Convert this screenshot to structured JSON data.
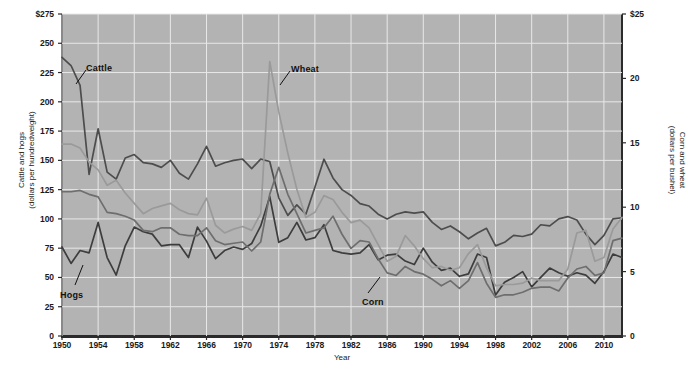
{
  "chart_data": {
    "type": "line",
    "title": "",
    "xlabel": "Year",
    "ylabel_left": "Cattle and hogs\n(dollars per hundredweight)",
    "ylabel_right": "Corn and wheat\n(dollars per bushel)",
    "grid": true,
    "legend_position": "inline-annotations",
    "xlim": [
      1950,
      2012
    ],
    "ylim_left": [
      0,
      275
    ],
    "ylim_right": [
      0,
      25
    ],
    "x": [
      1950,
      1951,
      1952,
      1953,
      1954,
      1955,
      1956,
      1957,
      1958,
      1959,
      1960,
      1961,
      1962,
      1963,
      1964,
      1965,
      1966,
      1967,
      1968,
      1969,
      1970,
      1971,
      1972,
      1973,
      1974,
      1975,
      1976,
      1977,
      1978,
      1979,
      1980,
      1981,
      1982,
      1983,
      1984,
      1985,
      1986,
      1987,
      1988,
      1989,
      1990,
      1991,
      1992,
      1993,
      1994,
      1995,
      1996,
      1997,
      1998,
      1999,
      2000,
      2001,
      2002,
      2003,
      2004,
      2005,
      2006,
      2007,
      2008,
      2009,
      2010,
      2011,
      2012
    ],
    "xticks": [
      "1950",
      "1954",
      "1958",
      "1962",
      "1966",
      "1970",
      "1974",
      "1978",
      "1982",
      "1986",
      "1990",
      "1994",
      "1998",
      "2002",
      "2006",
      "2010"
    ],
    "yticks_left": [
      "0",
      "25",
      "50",
      "75",
      "100",
      "125",
      "150",
      "175",
      "200",
      "225",
      "250",
      "$275"
    ],
    "yticks_right": [
      "0",
      "5",
      "10",
      "15",
      "20",
      "$25"
    ],
    "series": [
      {
        "name": "Cattle",
        "axis": "left",
        "color": "#4d4d4d",
        "unit": "dollars per hundredweight",
        "values": [
          238,
          231,
          214,
          138,
          177,
          140,
          134,
          152,
          155,
          148,
          147,
          144,
          150,
          139,
          134,
          147,
          162,
          145,
          148,
          150,
          151,
          143,
          151,
          149,
          118,
          103,
          112,
          104,
          127,
          151,
          135,
          125,
          120,
          113,
          111,
          104,
          100,
          104,
          106,
          105,
          106,
          97,
          91,
          94,
          89,
          83,
          88,
          92,
          77,
          80,
          86,
          85,
          87,
          95,
          94,
          100,
          102,
          99,
          87,
          78,
          86,
          100,
          101
        ]
      },
      {
        "name": "Hogs",
        "axis": "left",
        "color": "#3d3d3d",
        "unit": "dollars per hundredweight",
        "values": [
          76,
          62,
          73,
          71,
          97,
          67,
          52,
          77,
          93,
          89,
          87,
          77,
          78,
          78,
          67,
          93,
          81,
          66,
          73,
          76,
          74,
          79,
          94,
          119,
          80,
          84,
          97,
          82,
          84,
          95,
          73,
          71,
          70,
          71,
          78,
          65,
          69,
          70,
          64,
          61,
          75,
          63,
          56,
          58,
          51,
          53,
          70,
          67,
          35,
          46,
          50,
          55,
          42,
          50,
          58,
          54,
          51,
          54,
          52,
          45,
          55,
          70,
          67
        ]
      },
      {
        "name": "Corn",
        "axis": "right",
        "color": "#6e6e6e",
        "unit": "dollars per bushel",
        "values": [
          11.2,
          11.2,
          11.3,
          11.0,
          10.8,
          9.6,
          9.5,
          9.3,
          9.0,
          8.2,
          8.1,
          8.4,
          8.4,
          7.9,
          7.8,
          7.8,
          8.4,
          7.4,
          7.1,
          7.2,
          7.3,
          6.6,
          7.3,
          11.0,
          13.1,
          11.0,
          9.5,
          8.0,
          8.2,
          8.4,
          9.3,
          7.9,
          6.8,
          7.4,
          7.3,
          6.0,
          4.9,
          4.7,
          5.4,
          5.0,
          4.8,
          4.4,
          3.9,
          4.3,
          3.7,
          4.3,
          5.7,
          4.1,
          3.0,
          3.2,
          3.2,
          3.4,
          3.7,
          3.8,
          3.8,
          3.5,
          4.5,
          5.2,
          5.4,
          4.7,
          4.9,
          7.4,
          7.6
        ]
      },
      {
        "name": "Wheat",
        "axis": "right",
        "color": "#9a9a9a",
        "unit": "dollars per bushel",
        "values": [
          14.9,
          14.9,
          14.6,
          13.5,
          12.9,
          11.7,
          12.1,
          11.1,
          10.3,
          9.5,
          9.9,
          10.1,
          10.3,
          9.8,
          9.5,
          9.4,
          10.7,
          8.6,
          8.0,
          8.3,
          8.5,
          8.2,
          9.5,
          21.3,
          17.4,
          14.2,
          11.4,
          9.2,
          9.6,
          10.9,
          10.6,
          9.6,
          8.8,
          9.0,
          8.4,
          7.1,
          5.8,
          6.2,
          7.8,
          7.0,
          6.0,
          5.3,
          5.4,
          5.1,
          5.3,
          6.4,
          7.1,
          5.3,
          3.9,
          4.0,
          4.0,
          4.1,
          4.5,
          4.3,
          4.3,
          4.3,
          5.2,
          8.0,
          8.2,
          5.8,
          6.1,
          8.3,
          9.2
        ]
      }
    ],
    "annotations": [
      {
        "text": "Cattle",
        "x_px": 86,
        "y_px": 63
      },
      {
        "text": "Hogs",
        "x_px": 60,
        "y_px": 290
      },
      {
        "text": "Wheat",
        "x_px": 291,
        "y_px": 64
      },
      {
        "text": "Corn",
        "x_px": 362,
        "y_px": 297
      }
    ]
  }
}
